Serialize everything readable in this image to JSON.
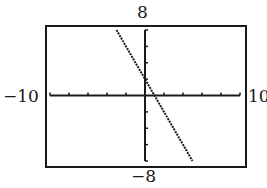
{
  "chart_data": {
    "type": "line",
    "title": "",
    "xlabel": "",
    "ylabel": "",
    "window": {
      "xmin": -10,
      "xmax": 10,
      "ymin": -8,
      "ymax": 8,
      "xscl": 2,
      "yscl": 2
    },
    "xlim": [
      -10,
      10
    ],
    "ylim": [
      -8,
      8
    ],
    "grid": false,
    "legend": null,
    "series": [
      {
        "name": "y = -2x + 2",
        "x": [
          -3,
          -2,
          -1,
          0,
          1,
          2,
          3,
          4,
          5
        ],
        "y": [
          8,
          6,
          4,
          2,
          0,
          -2,
          -4,
          -6,
          -8
        ]
      }
    ],
    "intercepts": {
      "x_intercept": 1,
      "y_intercept": 2
    },
    "tick_labels": {
      "x_min": "−10",
      "x_max": "10",
      "y_min": "−8",
      "y_max": "8"
    }
  },
  "labels": {
    "y_max": "8",
    "y_min": "−8",
    "x_min": "−10",
    "x_max": "10"
  },
  "colors": {
    "ink": "#1a1a1a",
    "background": "#ffffff"
  }
}
